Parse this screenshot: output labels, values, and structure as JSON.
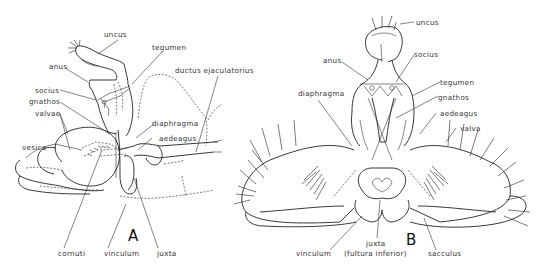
{
  "figure": {
    "panel_a": {
      "letter": "A",
      "labels": {
        "uncus": "uncus",
        "tegumen": "tegumen",
        "anus": "anus",
        "ductus": "ductus ejaculatorius",
        "socius": "socius",
        "gnathos": "gnathos",
        "valvae": "valvae",
        "diaphragma": "diaphragma",
        "vesica": "vesica",
        "aedeagus": "aedeagus",
        "cornuti": "cornuti",
        "vinculum": "vinculum",
        "juxta": "juxta"
      }
    },
    "panel_b": {
      "letter": "B",
      "labels": {
        "uncus": "uncus",
        "socius": "socius",
        "anus": "anus",
        "tegumen": "tegumen",
        "diaphragma": "diaphragma",
        "gnathos": "gnathos",
        "aedeagus": "aedeagus",
        "valva": "valva",
        "vinculum": "vinculum",
        "juxta": "juxta",
        "juxta_alt": "(fultura inferior)",
        "sacculus": "sacculus"
      }
    }
  }
}
